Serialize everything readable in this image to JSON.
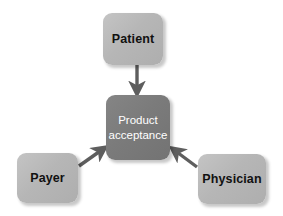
{
  "diagram": {
    "background_color": "#ffffff",
    "node_color": "#b6b6b6",
    "center_node_color": "#7b7b7b",
    "arrow_color": "#5e5e5e",
    "node_text_color": "#111111",
    "center_text_color": "#ffffff",
    "nodes": {
      "patient": {
        "label": "Patient",
        "role": "source"
      },
      "product": {
        "label": "Product\nacceptance",
        "role": "target"
      },
      "payer": {
        "label": "Payer",
        "role": "source"
      },
      "physician": {
        "label": "Physician",
        "role": "source"
      }
    },
    "arrows": [
      {
        "name": "patient-to-product",
        "from": "patient",
        "to": "product",
        "direction": "down"
      },
      {
        "name": "payer-to-product",
        "from": "payer",
        "to": "product",
        "direction": "up-right"
      },
      {
        "name": "physician-to-product",
        "from": "physician",
        "to": "product",
        "direction": "up-left"
      }
    ]
  }
}
